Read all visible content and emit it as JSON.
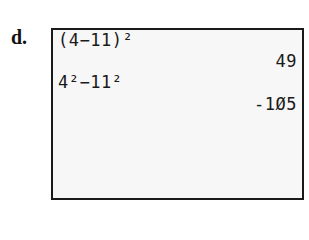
{
  "problem_label": "d.",
  "calculator_screen": {
    "lines": [
      {
        "text": "(4−11)²",
        "align": "left"
      },
      {
        "text": "49",
        "align": "right"
      },
      {
        "text": "4²−11²",
        "align": "left"
      },
      {
        "text": "-1Ø5",
        "align": "right"
      }
    ]
  }
}
